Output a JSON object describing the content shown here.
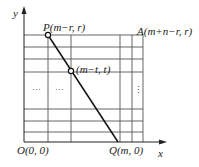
{
  "diagram": {
    "axes": {
      "x_label": "x",
      "y_label": "y"
    },
    "points": {
      "P": {
        "label": "P(m−r, r)"
      },
      "T": {
        "label": "(m−t, t)"
      },
      "A": {
        "label": "A(m+n−r, r)"
      },
      "O": {
        "label": "O(0, 0)"
      },
      "Q": {
        "label": "Q(m, 0)"
      }
    },
    "ellipsis": {
      "horizontal": "···",
      "vertical": "⋮"
    },
    "colors": {
      "line": "#111111",
      "grid": "#555555",
      "background": "#ffffff"
    }
  }
}
